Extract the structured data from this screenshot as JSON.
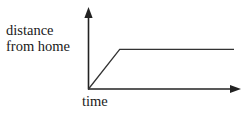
{
  "figure": {
    "part_label": "b.",
    "background_color": "#ffffff",
    "ink_color": "#222222"
  },
  "axes": {
    "y_label_line1": "distance",
    "y_label_line2": "from home",
    "x_label": "time",
    "y_axis_arrow": "arrow-up",
    "x_axis_arrow": "arrow-right",
    "origin_label": "",
    "tick_labels": []
  },
  "chart_data": {
    "type": "line",
    "title": "",
    "subtitle": "",
    "xlabel": "time",
    "ylabel": "distance from home",
    "xlim": [
      0,
      100
    ],
    "ylim": [
      0,
      100
    ],
    "grid": false,
    "legend": "none",
    "axis_ticks": false,
    "axis_numbers": false,
    "series": [
      {
        "name": "distance from home",
        "color": "#333333",
        "x": [
          0,
          21,
          98
        ],
        "y": [
          0,
          70,
          70
        ],
        "segments": [
          {
            "name": "linear-increase",
            "from": [
              0,
              0
            ],
            "to": [
              21,
              70
            ]
          },
          {
            "name": "constant-plateau",
            "from": [
              21,
              70
            ],
            "to": [
              98,
              70
            ]
          }
        ]
      }
    ],
    "annotations": []
  }
}
